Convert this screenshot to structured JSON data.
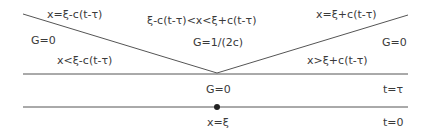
{
  "diagram": {
    "type": "characteristic-cone",
    "colors": {
      "line": "#555555",
      "text": "#3a3a3a",
      "background": "#ffffff"
    },
    "lines": {
      "t_tau": {
        "label": "t=τ"
      },
      "t_zero": {
        "label": "t=0"
      },
      "left_characteristic": {
        "label": "x=ξ-c(t-τ)"
      },
      "right_characteristic": {
        "label": "x=ξ+c(t-τ)"
      }
    },
    "regions": {
      "left": {
        "value": "G=0",
        "condition": "x<ξ-c(t-τ)"
      },
      "middle": {
        "value": "G=1/(2c)",
        "condition": "ξ-c(t-τ)<x<ξ+c(t-τ)"
      },
      "right": {
        "value": "G=0",
        "condition": "x>ξ+c(t-τ)"
      },
      "between_lines": {
        "value": "G=0"
      }
    },
    "source_point": {
      "label": "x=ξ"
    }
  }
}
